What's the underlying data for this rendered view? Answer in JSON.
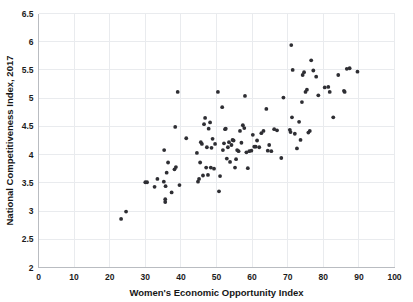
{
  "chart_data": {
    "type": "scatter",
    "title": "",
    "xlabel": "Women's Economic Opportunity Index",
    "ylabel": "National Competitiveness Index, 2017",
    "xlim": [
      0,
      100
    ],
    "ylim": [
      2,
      6.5
    ],
    "xticks": [
      0,
      10,
      20,
      30,
      40,
      50,
      60,
      70,
      80,
      90,
      100
    ],
    "yticks": [
      2,
      2.5,
      3,
      3.5,
      4,
      4.5,
      5,
      5.5,
      6,
      6.5
    ],
    "xtick_labels": [
      "0",
      "10",
      "20",
      "30",
      "40",
      "50",
      "60",
      "70",
      "80",
      "90",
      "100"
    ],
    "ytick_labels": [
      "2",
      "2.5",
      "3",
      "3.5",
      "4",
      "4.5",
      "5",
      "5.5",
      "6",
      "6.5"
    ],
    "grid": true,
    "legend": false,
    "marker_color": "#2e2e33",
    "grid_color": "#e9ebee",
    "background_color": "#ffffff",
    "points": [
      [
        23.2,
        2.86
      ],
      [
        24.6,
        2.99
      ],
      [
        30.0,
        3.51
      ],
      [
        30.5,
        3.51
      ],
      [
        32.6,
        3.43
      ],
      [
        33.4,
        3.57
      ],
      [
        35.2,
        3.52
      ],
      [
        35.3,
        4.08
      ],
      [
        35.6,
        3.21
      ],
      [
        35.6,
        3.16
      ],
      [
        35.7,
        3.44
      ],
      [
        36.0,
        3.68
      ],
      [
        36.4,
        3.86
      ],
      [
        37.4,
        3.33
      ],
      [
        38.2,
        3.74
      ],
      [
        38.4,
        4.49
      ],
      [
        38.6,
        3.78
      ],
      [
        39.1,
        5.11
      ],
      [
        39.6,
        3.46
      ],
      [
        41.5,
        4.29
      ],
      [
        44.5,
        4.03
      ],
      [
        44.8,
        3.52
      ],
      [
        45.1,
        3.57
      ],
      [
        45.4,
        3.86
      ],
      [
        45.6,
        4.22
      ],
      [
        45.9,
        4.19
      ],
      [
        46.2,
        3.63
      ],
      [
        46.5,
        4.54
      ],
      [
        46.8,
        4.65
      ],
      [
        47.1,
        3.77
      ],
      [
        47.3,
        4.13
      ],
      [
        47.6,
        3.64
      ],
      [
        47.8,
        4.46
      ],
      [
        48.2,
        4.57
      ],
      [
        48.4,
        3.77
      ],
      [
        48.6,
        4.12
      ],
      [
        48.9,
        4.28
      ],
      [
        49.3,
        3.75
      ],
      [
        49.6,
        4.19
      ],
      [
        50.4,
        5.11
      ],
      [
        50.7,
        3.35
      ],
      [
        51.0,
        3.62
      ],
      [
        51.6,
        4.84
      ],
      [
        51.8,
        4.08
      ],
      [
        52.1,
        4.2
      ],
      [
        52.4,
        4.45
      ],
      [
        52.6,
        4.46
      ],
      [
        52.9,
        3.93
      ],
      [
        53.2,
        4.13
      ],
      [
        53.5,
        4.22
      ],
      [
        53.8,
        3.87
      ],
      [
        54.2,
        4.17
      ],
      [
        54.5,
        4.26
      ],
      [
        54.8,
        4.25
      ],
      [
        55.2,
        3.77
      ],
      [
        55.5,
        3.92
      ],
      [
        55.8,
        4.08
      ],
      [
        56.2,
        4.06
      ],
      [
        56.6,
        4.42
      ],
      [
        57.0,
        4.21
      ],
      [
        57.4,
        4.52
      ],
      [
        57.8,
        4.47
      ],
      [
        58.0,
        5.04
      ],
      [
        58.4,
        4.04
      ],
      [
        58.8,
        3.76
      ],
      [
        59.2,
        4.06
      ],
      [
        59.8,
        4.07
      ],
      [
        60.2,
        4.35
      ],
      [
        60.6,
        4.14
      ],
      [
        61.0,
        4.14
      ],
      [
        61.4,
        4.25
      ],
      [
        62.0,
        4.13
      ],
      [
        62.6,
        4.38
      ],
      [
        63.2,
        4.42
      ],
      [
        64.0,
        4.81
      ],
      [
        64.4,
        4.07
      ],
      [
        64.8,
        4.17
      ],
      [
        65.4,
        4.06
      ],
      [
        66.2,
        4.45
      ],
      [
        67.0,
        4.43
      ],
      [
        68.2,
        3.94
      ],
      [
        68.8,
        5.01
      ],
      [
        70.6,
        4.44
      ],
      [
        70.8,
        4.4
      ],
      [
        71.0,
        5.94
      ],
      [
        71.2,
        4.66
      ],
      [
        71.4,
        5.5
      ],
      [
        72.0,
        4.37
      ],
      [
        72.6,
        4.11
      ],
      [
        73.2,
        4.58
      ],
      [
        73.6,
        4.26
      ],
      [
        74.0,
        4.93
      ],
      [
        74.2,
        5.41
      ],
      [
        74.6,
        5.46
      ],
      [
        75.0,
        5.11
      ],
      [
        75.4,
        5.15
      ],
      [
        75.8,
        4.39
      ],
      [
        76.2,
        4.42
      ],
      [
        76.6,
        5.67
      ],
      [
        77.2,
        5.49
      ],
      [
        78.0,
        5.38
      ],
      [
        78.6,
        5.05
      ],
      [
        80.4,
        5.19
      ],
      [
        81.4,
        5.2
      ],
      [
        81.8,
        5.11
      ],
      [
        82.8,
        4.66
      ],
      [
        84.2,
        5.41
      ],
      [
        85.8,
        5.13
      ],
      [
        86.0,
        5.11
      ],
      [
        86.6,
        5.52
      ],
      [
        87.4,
        5.53
      ],
      [
        89.6,
        5.47
      ]
    ]
  }
}
